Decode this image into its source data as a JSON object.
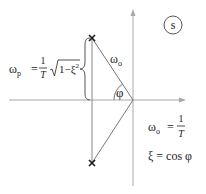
{
  "diagram": {
    "plane_label": "s",
    "colors": {
      "axis": "#a8a8a8",
      "line": "#777777",
      "pole": "#1a1a1a",
      "text": "#222222"
    },
    "poles": [
      {
        "name": "upper-pole",
        "symbol": "×",
        "x": 92,
        "y": 38
      },
      {
        "name": "lower-pole",
        "symbol": "×",
        "x": 92,
        "y": 163
      }
    ],
    "labels": {
      "omega_o_hyp": "ω",
      "omega_o_hyp_sub": "o",
      "phi": "φ",
      "omega_p_lhs": "ω",
      "omega_p_sub": "p",
      "omega_p_eq": "=",
      "omega_p_num": "1",
      "omega_p_den": "T",
      "omega_p_sqrt_body": "1−ξ",
      "omega_p_sqrt_exp": "2",
      "omega_o_def_lhs": "ω",
      "omega_o_def_sub": "o",
      "omega_o_def_eq": "=",
      "omega_o_def_num": "1",
      "omega_o_def_den": "T",
      "xi_def": "ξ = cos φ"
    }
  }
}
